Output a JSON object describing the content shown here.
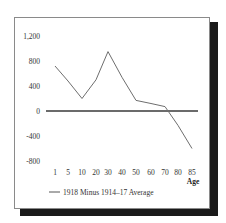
{
  "chart_data": {
    "type": "line",
    "title": "",
    "xlabel": "Age",
    "ylabel": "",
    "categories": [
      "1",
      "5",
      "10",
      "20",
      "30",
      "40",
      "50",
      "60",
      "70",
      "80",
      "85"
    ],
    "series": [
      {
        "name": "1918 Minus 1914–17 Average",
        "values": [
          720,
          480,
          200,
          500,
          950,
          540,
          170,
          120,
          70,
          -230,
          -600
        ]
      }
    ],
    "yticks": [
      "1,200",
      "800",
      "400",
      "0",
      "-400",
      "-800"
    ],
    "ylim": [
      -800,
      1200
    ],
    "grid": false,
    "zero_line": true,
    "legend_position": "bottom-left"
  },
  "colors": {
    "line": "#6e6e6e",
    "zero_line": "#3a3a3a",
    "frame_shadow": "#1a1a1a"
  }
}
